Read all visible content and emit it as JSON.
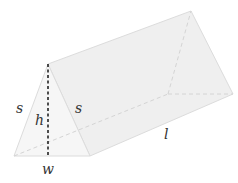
{
  "figure": {
    "labels": {
      "side_left": "s",
      "side_right": "s",
      "height": "h",
      "width": "w",
      "length": "l"
    },
    "colors": {
      "face_fill": "#f1f1f1",
      "front_fill": "#f6f6f6",
      "edge": "#dcdcdc",
      "height_line": "#222222",
      "label": "#333333"
    }
  }
}
